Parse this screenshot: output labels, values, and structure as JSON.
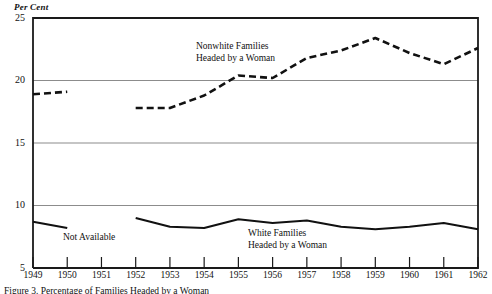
{
  "figure": {
    "y_axis_unit": "Per Cent",
    "caption": "Figure 3. Percentage of Families Headed by a Woman"
  },
  "annotations": {
    "nonwhite_line1": "Nonwhite Families",
    "nonwhite_line2": "Headed by a Woman",
    "white_line1": "White Families",
    "white_line2": "Headed by a Woman",
    "not_available": "Not Available"
  },
  "chart_data": {
    "type": "line",
    "title": "",
    "xlabel": "",
    "ylabel": "Per Cent",
    "xlim": [
      1949,
      1962
    ],
    "ylim": [
      5,
      25
    ],
    "yticks": [
      5,
      10,
      15,
      20,
      25
    ],
    "ytick_labels": [
      "5",
      "10",
      "15",
      "20",
      "25"
    ],
    "xticks": [
      1949,
      1950,
      1951,
      1952,
      1953,
      1954,
      1955,
      1956,
      1957,
      1958,
      1959,
      1960,
      1961,
      1962
    ],
    "xtick_labels": [
      "1949",
      "1950",
      "1951",
      "1952",
      "1953",
      "1954",
      "1955",
      "1956",
      "1957",
      "1958",
      "1959",
      "1960",
      "1961",
      "1962"
    ],
    "grid": "horizontal",
    "legend_position": "inline-annotation",
    "series": [
      {
        "name": "Nonwhite Families Headed by a Woman",
        "style": "dashed",
        "color": "#111111",
        "segments": [
          {
            "x": [
              1949,
              1950
            ],
            "values": [
              18.9,
              19.1
            ]
          },
          {
            "x": [
              1952,
              1953,
              1954,
              1955,
              1956,
              1957,
              1958,
              1959,
              1960,
              1961,
              1962
            ],
            "values": [
              17.8,
              17.8,
              18.8,
              20.4,
              20.2,
              21.8,
              22.4,
              23.4,
              22.2,
              21.3,
              22.6
            ]
          }
        ],
        "gap_note": "Not Available for 1951"
      },
      {
        "name": "White Families Headed by a Woman",
        "style": "solid",
        "color": "#111111",
        "segments": [
          {
            "x": [
              1949,
              1950
            ],
            "values": [
              8.7,
              8.2
            ]
          },
          {
            "x": [
              1952,
              1953,
              1954,
              1955,
              1956,
              1957,
              1958,
              1959,
              1960,
              1961,
              1962
            ],
            "values": [
              9.0,
              8.3,
              8.2,
              8.9,
              8.6,
              8.8,
              8.3,
              8.1,
              8.3,
              8.6,
              8.1
            ]
          }
        ],
        "gap_note": "Not Available for 1951"
      }
    ]
  },
  "colors": {
    "ink": "#111111",
    "gridline": "#8c8c8c",
    "frame": "#1a1a1a",
    "background": "#ffffff"
  }
}
